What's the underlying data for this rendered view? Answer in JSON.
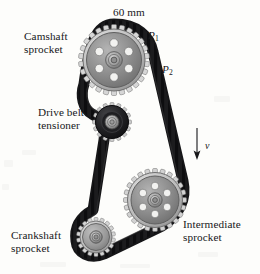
{
  "figure": {
    "kind": "mechanical-diagram",
    "background_color": "#fdfdfb",
    "ink_color": "#17171a"
  },
  "labels": {
    "dimension": "60 mm",
    "camshaft": "Camshaft\nsprocket",
    "tensioner": "Drive belt\ntensioner",
    "crankshaft": "Crankshaft\nsprocket",
    "intermediate": "Intermediate\nsprocket",
    "tension_1": "P",
    "tension_1_sub": "1",
    "tension_2": "P",
    "tension_2_sub": "2",
    "velocity": "v"
  },
  "components": [
    {
      "name": "camshaft-sprocket",
      "label": "Camshaft sprocket",
      "cx": 114,
      "cy": 60,
      "outer_radius": 35,
      "teeth": 26,
      "body_radius": 28,
      "body_color": "#8c8c8c",
      "bolt_holes": 6,
      "bolt_hole_radius": 4.2,
      "bolt_circle_radius": 17,
      "hub_radius": 8,
      "diameter_label": "60 mm"
    },
    {
      "name": "drive-belt-tensioner",
      "label": "Drive belt tensioner",
      "cx": 112,
      "cy": 122,
      "outer_radius": 19,
      "teeth": 16,
      "body_radius": 17,
      "body_color": "#1b1b1d",
      "bolt_holes": 0,
      "hub_radius": 7
    },
    {
      "name": "intermediate-sprocket",
      "label": "Intermediate sprocket",
      "cx": 155,
      "cy": 200,
      "outer_radius": 31,
      "teeth": 24,
      "body_radius": 24,
      "body_color": "#8c8c8c",
      "bolt_holes": 6,
      "bolt_hole_radius": 3.8,
      "bolt_circle_radius": 14,
      "hub_radius": 7
    },
    {
      "name": "crankshaft-sprocket",
      "label": "Crankshaft sprocket",
      "cx": 96,
      "cy": 237,
      "outer_radius": 19,
      "teeth": 18,
      "body_radius": 15,
      "body_color": "#9a9a9a",
      "bolt_holes": 0,
      "hub_radius": 6
    }
  ],
  "belt": {
    "color": "#1c1c1e",
    "thickness": 8,
    "tooth_pitch": 7,
    "runs": [
      {
        "from": "camshaft-sprocket",
        "to": "intermediate-sprocket",
        "side": "right",
        "tension_label": "P2"
      },
      {
        "from": "intermediate-sprocket",
        "to": "crankshaft-sprocket",
        "side": "bottom"
      },
      {
        "from": "crankshaft-sprocket",
        "to": "drive-belt-tensioner",
        "side": "left"
      },
      {
        "from": "drive-belt-tensioner",
        "to": "camshaft-sprocket",
        "side": "left",
        "tension_label": "P1"
      }
    ]
  },
  "annotations": [
    {
      "name": "velocity-arrow",
      "label": "v",
      "direction": "downward",
      "x": 196,
      "y": 132
    },
    {
      "name": "tension-p1",
      "label": "P1",
      "x": 148,
      "y": 29
    },
    {
      "name": "tension-p2",
      "label": "P2",
      "x": 162,
      "y": 63
    },
    {
      "name": "dimension-60mm",
      "label": "60 mm",
      "x": 113,
      "y": 6
    }
  ]
}
